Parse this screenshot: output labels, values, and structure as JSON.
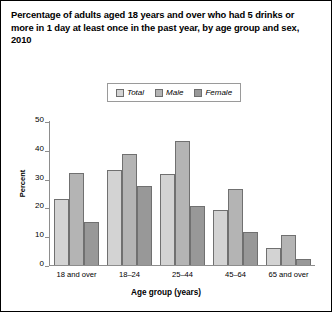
{
  "chart_data": {
    "type": "bar",
    "title": "Percentage of adults aged 18 years and over who had 5 drinks or more in 1 day at least once in the past year, by age group and sex, 2010",
    "xlabel": "Age group (years)",
    "ylabel": "Percent",
    "categories": [
      "18 and over",
      "18–24",
      "25–44",
      "45–64",
      "65 and over"
    ],
    "series": [
      {
        "name": "Total",
        "color": "#d3d3d3",
        "values": [
          23,
          33,
          31.5,
          19,
          6
        ]
      },
      {
        "name": "Male",
        "color": "#b4b4b4",
        "values": [
          32,
          38.5,
          43,
          26.5,
          10.5
        ]
      },
      {
        "name": "Female",
        "color": "#989898",
        "values": [
          15,
          27.5,
          20.5,
          11.5,
          2
        ]
      }
    ],
    "ylim": [
      0,
      50
    ],
    "yticks": [
      0,
      10,
      20,
      30,
      40,
      50
    ],
    "ytick_labels": [
      "0",
      "10",
      "20",
      "30",
      "40",
      "50"
    ],
    "grid": false,
    "legend_position": "top-center"
  }
}
